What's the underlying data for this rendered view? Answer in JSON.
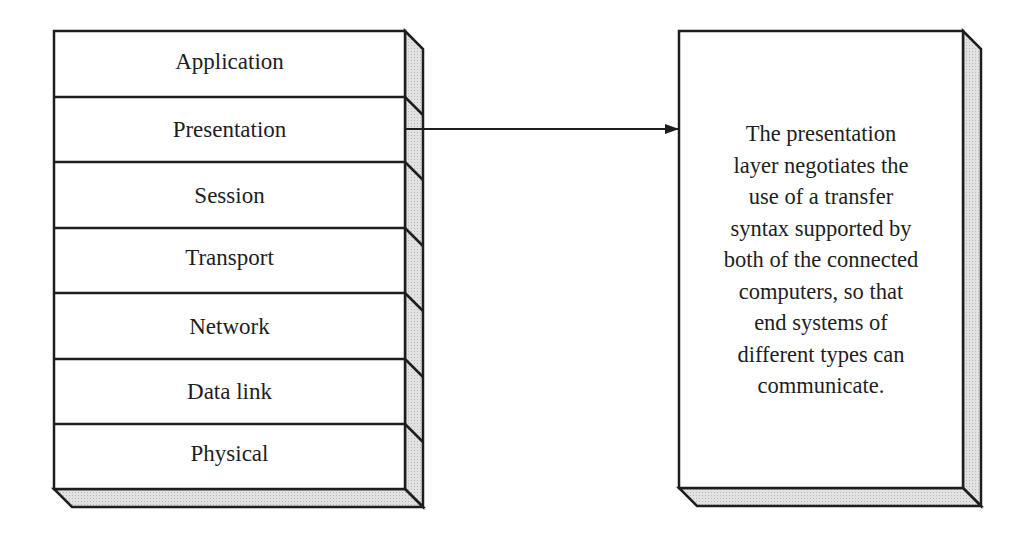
{
  "diagram": {
    "layers": [
      {
        "label": "Application"
      },
      {
        "label": "Presentation"
      },
      {
        "label": "Session"
      },
      {
        "label": "Transport"
      },
      {
        "label": "Network"
      },
      {
        "label": "Data link"
      },
      {
        "label": "Physical"
      }
    ],
    "highlighted_layer": "Presentation",
    "description_lines": [
      "The presentation",
      "layer negotiates the",
      "use of a transfer",
      "syntax supported by",
      "both of the connected",
      "computers, so that",
      "end systems of",
      "different types can",
      "communicate."
    ],
    "colors": {
      "stroke": "#1e1e1e",
      "face": "#ffffff",
      "side_shade": "#d6d6d6"
    }
  }
}
